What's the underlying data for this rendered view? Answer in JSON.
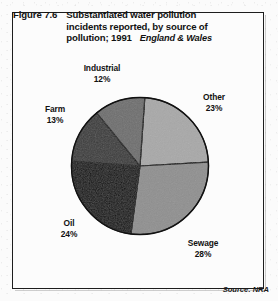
{
  "figure": {
    "number": "Figure 7.6",
    "title_line1": "Substantiated water pollution",
    "title_line2": "incidents reported, by source of",
    "title_line3": "pollution; 1991",
    "region": "England & Wales",
    "source": "Source: NRA"
  },
  "labels": {
    "industrial_name": "Industrial",
    "industrial_pct": "12%",
    "other_name": "Other",
    "other_pct": "23%",
    "farm_name": "Farm",
    "farm_pct": "13%",
    "oil_name": "Oil",
    "oil_pct": "24%",
    "sewage_name": "Sewage",
    "sewage_pct": "28%"
  },
  "chart_data": {
    "type": "pie",
    "title": "Substantiated water pollution incidents reported, by source of pollution; 1991",
    "subtitle": "England & Wales",
    "source": "Source: NRA",
    "unit": "percent",
    "start_angle_deg": 4,
    "direction": "clockwise",
    "categories": [
      "Other",
      "Sewage",
      "Oil",
      "Farm",
      "Industrial"
    ],
    "values": [
      23,
      28,
      24,
      13,
      12
    ],
    "colors": [
      "#a8a8a8",
      "#8f8f8f",
      "#0d0d0d",
      "#3a3a3a",
      "#6e6e6e"
    ],
    "slices": [
      {
        "label": "Other",
        "value": 23,
        "color": "#a8a8a8"
      },
      {
        "label": "Sewage",
        "value": 28,
        "color": "#8f8f8f"
      },
      {
        "label": "Oil",
        "value": 24,
        "color": "#0d0d0d"
      },
      {
        "label": "Farm",
        "value": 13,
        "color": "#3a3a3a"
      },
      {
        "label": "Industrial",
        "value": 12,
        "color": "#6e6e6e"
      }
    ],
    "legend": "none",
    "grid": false,
    "total": 100
  }
}
